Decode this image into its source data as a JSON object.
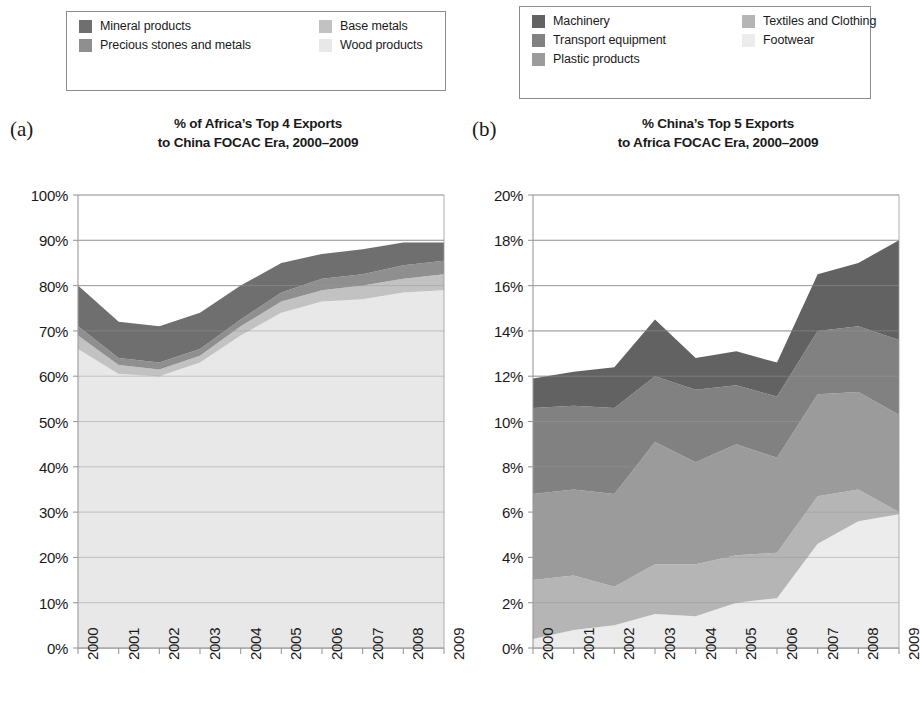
{
  "figure": {
    "panels": [
      {
        "letter": "(a)",
        "title_line1": "% of Africa’s Top 4 Exports",
        "title_line2": "to China FOCAC Era, 2000–2009"
      },
      {
        "letter": "(b)",
        "title_line1": "% China’s Top 5 Exports",
        "title_line2": "to Africa FOCAC Era, 2000–2009"
      }
    ]
  },
  "legends": [
    {
      "id": "legend-a",
      "items": [
        {
          "label": "Mineral products",
          "color": "#6f6f6f"
        },
        {
          "label": "Base metals",
          "color": "#c2c2c2"
        },
        {
          "label": "Precious stones and metals",
          "color": "#8f8f8f"
        },
        {
          "label": "Wood products",
          "color": "#e8e8e8"
        }
      ]
    },
    {
      "id": "legend-b",
      "items": [
        {
          "label": "Machinery",
          "color": "#626262"
        },
        {
          "label": "Textiles and Clothing",
          "color": "#b5b5b5"
        },
        {
          "label": "Transport equipment",
          "color": "#818181"
        },
        {
          "label": "Footwear",
          "color": "#ececec"
        },
        {
          "label": "Plastic products",
          "color": "#9b9b9b"
        }
      ]
    }
  ],
  "chart_data": [
    {
      "type": "area",
      "stacked": true,
      "title": "% of Africa’s Top 4 Exports to China FOCAC Era, 2000–2009",
      "xlabel": "",
      "ylabel": "",
      "grid": true,
      "legend_position": "top",
      "x": [
        2000,
        2001,
        2002,
        2003,
        2004,
        2005,
        2006,
        2007,
        2008,
        2009
      ],
      "xtick_labels": [
        "2000",
        "2001",
        "2002",
        "2003",
        "2004",
        "2005",
        "2006",
        "2007",
        "2008",
        "2009"
      ],
      "ylim": [
        0,
        100
      ],
      "ytick_labels": [
        "0%",
        "10%",
        "20%",
        "30%",
        "40%",
        "50%",
        "60%",
        "70%",
        "80%",
        "90%",
        "100%"
      ],
      "ytick_values": [
        0,
        10,
        20,
        30,
        40,
        50,
        60,
        70,
        80,
        90,
        100
      ],
      "series": [
        {
          "name": "Wood products",
          "color": "#e8e8e8",
          "values": [
            66.0,
            60.5,
            60.0,
            63.0,
            69.0,
            74.0,
            76.5,
            77.0,
            78.5,
            79.0
          ]
        },
        {
          "name": "Base metals",
          "color": "#c2c2c2",
          "values": [
            3.0,
            2.0,
            1.5,
            1.5,
            2.0,
            2.5,
            2.5,
            3.0,
            3.0,
            3.5
          ]
        },
        {
          "name": "Precious stones and metals",
          "color": "#8f8f8f",
          "values": [
            2.0,
            1.5,
            1.5,
            1.5,
            1.5,
            2.0,
            2.5,
            2.5,
            3.0,
            3.0
          ]
        },
        {
          "name": "Mineral products",
          "color": "#6f6f6f",
          "values": [
            9.0,
            8.0,
            8.0,
            8.0,
            7.5,
            6.5,
            5.5,
            5.5,
            5.0,
            4.0
          ]
        }
      ],
      "totals": [
        80.0,
        72.0,
        71.0,
        74.0,
        80.0,
        85.0,
        87.0,
        88.0,
        89.5,
        89.5
      ]
    },
    {
      "type": "area",
      "stacked": true,
      "title": "% China’s Top 5 Exports to Africa FOCAC Era, 2000–2009",
      "xlabel": "",
      "ylabel": "",
      "grid": true,
      "legend_position": "top",
      "x": [
        2000,
        2001,
        2002,
        2003,
        2004,
        2005,
        2006,
        2007,
        2008,
        2009
      ],
      "xtick_labels": [
        "2000",
        "2001",
        "2002",
        "2003",
        "2004",
        "2005",
        "2006",
        "2007",
        "2008",
        "2009"
      ],
      "ylim": [
        0,
        20
      ],
      "ytick_labels": [
        "0%",
        "2%",
        "4%",
        "6%",
        "8%",
        "10%",
        "12%",
        "14%",
        "16%",
        "18%",
        "20%"
      ],
      "ytick_values": [
        0,
        2,
        4,
        6,
        8,
        10,
        12,
        14,
        16,
        18,
        20
      ],
      "series": [
        {
          "name": "Footwear",
          "color": "#ececec",
          "values": [
            0.4,
            0.8,
            1.0,
            1.5,
            1.4,
            2.0,
            2.2,
            4.6,
            5.6,
            5.9
          ]
        },
        {
          "name": "Textiles and Clothing",
          "color": "#b5b5b5",
          "values": [
            2.6,
            2.4,
            1.7,
            2.2,
            2.3,
            2.1,
            2.0,
            2.1,
            1.4,
            0.1
          ]
        },
        {
          "name": "Plastic products",
          "color": "#9b9b9b",
          "values": [
            3.8,
            3.8,
            4.1,
            5.4,
            4.5,
            4.9,
            4.2,
            4.5,
            4.3,
            4.3
          ]
        },
        {
          "name": "Transport equipment",
          "color": "#818181",
          "values": [
            3.8,
            3.7,
            3.8,
            2.9,
            3.2,
            2.6,
            2.7,
            2.8,
            2.9,
            3.3
          ]
        },
        {
          "name": "Machinery",
          "color": "#626262",
          "values": [
            1.3,
            1.5,
            1.8,
            2.5,
            1.4,
            1.5,
            1.5,
            2.5,
            2.8,
            4.4
          ]
        }
      ],
      "totals": [
        11.9,
        12.2,
        12.4,
        14.5,
        12.8,
        13.1,
        12.6,
        16.5,
        17.0,
        18.0
      ]
    }
  ],
  "style": {
    "axis_color": "#9a9a9a",
    "grid_color": "#9a9a9a",
    "text_color": "#1a1a1a",
    "background": "#ffffff"
  }
}
